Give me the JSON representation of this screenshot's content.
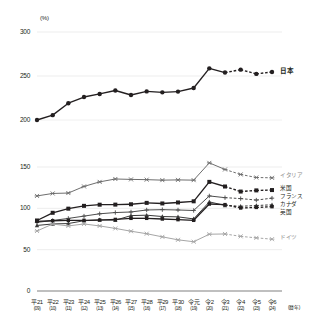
{
  "chart_data": {
    "type": "line",
    "title": "",
    "xlabel": "(暦年)",
    "ylabel": "(%)",
    "grid": true,
    "legend_position": "right-inline",
    "axis_break": true,
    "panels": [
      {
        "name": "upper",
        "ylim": [
          200,
          300
        ],
        "yticks": [
          200,
          250,
          300
        ]
      },
      {
        "name": "lower",
        "ylim": [
          0,
          150
        ],
        "yticks": [
          0,
          50,
          100,
          150
        ]
      }
    ],
    "categories": [
      "平21",
      "平22",
      "平23",
      "平24",
      "平25",
      "平26",
      "平27",
      "平28",
      "平29",
      "平30",
      "令元",
      "令2",
      "令3",
      "令4",
      "令5",
      "令6"
    ],
    "categories_sub": [
      "(09)",
      "(10)",
      "(11)",
      "(12)",
      "(13)",
      "(14)",
      "(15)",
      "(16)",
      "(17)",
      "(18)",
      "(19)",
      "(20)",
      "(21)",
      "(22)",
      "(23)",
      "(24)"
    ],
    "dashed_from_index": 12,
    "series": [
      {
        "name": "日本",
        "panel": "upper",
        "marker": "circle",
        "color": "#231f20",
        "values": [
          200.0,
          205.5,
          219.1,
          226.1,
          229.6,
          233.5,
          228.4,
          232.5,
          231.4,
          232.3,
          236.4,
          258.7,
          253.9,
          257.2,
          252.4,
          254.6
        ]
      },
      {
        "name": "イタリア",
        "panel": "lower",
        "marker": "cross",
        "color": "#6e6e6e",
        "values": [
          115.0,
          118.0,
          118.5,
          126.5,
          132.0,
          135.5,
          135.0,
          134.7,
          134.1,
          134.4,
          134.1,
          155.0,
          147.0,
          141.0,
          137.3,
          136.9
        ]
      },
      {
        "name": "米国",
        "panel": "lower",
        "marker": "square",
        "color": "#231f20",
        "values": [
          85.3,
          94.6,
          99.6,
          103.0,
          104.4,
          104.5,
          104.9,
          106.6,
          105.9,
          107.1,
          108.5,
          132.0,
          126.4,
          120.3,
          121.7,
          122.1
        ]
      },
      {
        "name": "フランス",
        "panel": "lower",
        "marker": "plus",
        "color": "#4d4d4d",
        "values": [
          83.0,
          85.3,
          87.8,
          90.6,
          93.4,
          94.9,
          95.6,
          98.0,
          98.4,
          98.0,
          97.4,
          115.0,
          112.9,
          111.8,
          110.0,
          112.3
        ]
      },
      {
        "name": "カナダ",
        "panel": "lower",
        "marker": "triangle",
        "color": "#3a3a3a",
        "values": [
          79.3,
          81.1,
          81.6,
          85.0,
          86.1,
          85.6,
          91.2,
          91.7,
          90.1,
          89.7,
          87.2,
          107.8,
          103.5,
          102.5,
          103.4,
          104.3
        ]
      },
      {
        "name": "英国",
        "panel": "lower",
        "marker": "square-sm",
        "color": "#231f20",
        "values": [
          84.2,
          85.0,
          85.4,
          85.5,
          85.8,
          86.6,
          87.9,
          87.9,
          87.1,
          86.3,
          85.5,
          105.2,
          104.5,
          100.4,
          101.1,
          102.0
        ]
      },
      {
        "name": "ドイツ",
        "panel": "lower",
        "marker": "cross",
        "color": "#a6a6a6",
        "values": [
          72.6,
          81.0,
          78.7,
          81.1,
          78.7,
          75.7,
          72.3,
          69.3,
          65.5,
          61.9,
          59.6,
          68.7,
          69.0,
          66.1,
          64.3,
          62.7
        ]
      }
    ]
  }
}
